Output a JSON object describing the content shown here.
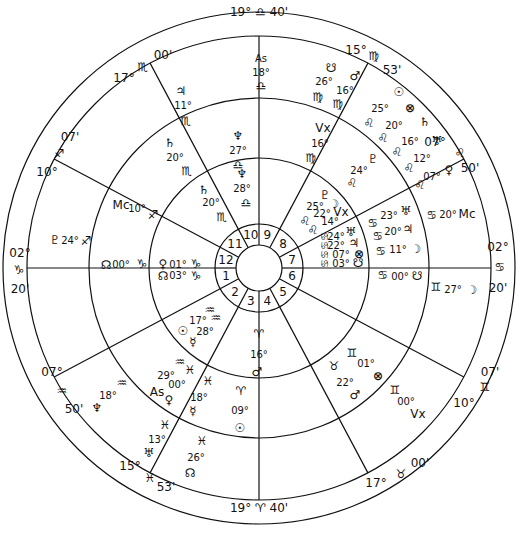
{
  "chart": {
    "center": [
      259,
      268
    ],
    "radii": {
      "outer": 256,
      "cusp_ring": 232,
      "middle": 170,
      "inner": 110,
      "house_ring": 44,
      "hub": 23
    },
    "stroke_color": "#111111",
    "background": "#ffffff"
  },
  "outer_cusps": [
    {
      "id": "cusp-10-top",
      "deg": "19°",
      "sign": "♎",
      "min": "40'",
      "x": 259,
      "y": 11
    },
    {
      "id": "cusp-11",
      "deg": "15°",
      "sign": "♍",
      "min": "53'",
      "x": 368,
      "y": 30
    },
    {
      "id": "cusp-12",
      "deg": "07°",
      "sign": "♌",
      "min": "50'",
      "x": 468,
      "y": 148
    },
    {
      "id": "cusp-1-right",
      "deg": "02°",
      "sign": "♋",
      "min": "20'",
      "x": 495,
      "y": 268
    },
    {
      "id": "cusp-2",
      "deg": "07'",
      "sign": "♊",
      "min": "10°",
      "x": 476,
      "y": 400
    },
    {
      "id": "cusp-3",
      "deg": "17°",
      "sign": "♉",
      "min": "00'",
      "x": 390,
      "y": 487
    },
    {
      "id": "cusp-4-bottom",
      "deg": "19°",
      "sign": "♈",
      "min": "40'",
      "x": 259,
      "y": 508
    },
    {
      "id": "cusp-5",
      "deg": "15°",
      "sign": "♓",
      "min": "53'",
      "x": 150,
      "y": 500
    },
    {
      "id": "cusp-6",
      "deg": "07°",
      "sign": "♒",
      "min": "50'",
      "x": 55,
      "y": 398
    },
    {
      "id": "cusp-7-left",
      "deg": "02°",
      "sign": "♑",
      "min": "20'",
      "x": 22,
      "y": 268
    },
    {
      "id": "cusp-8",
      "deg": "07'",
      "sign": "♐",
      "min": "10°",
      "x": 45,
      "y": 150
    },
    {
      "id": "cusp-9",
      "deg": "17°",
      "sign": "♏",
      "min": "00'",
      "x": 140,
      "y": 58
    }
  ],
  "house_numbers": [
    "1",
    "2",
    "3",
    "4",
    "5",
    "6",
    "7",
    "8",
    "9",
    "10",
    "11",
    "12"
  ],
  "outer_ring_points": [
    {
      "glyph": "As",
      "deg": "18°",
      "sign": "♎",
      "x": 268,
      "y": 80
    },
    {
      "glyph": "☋",
      "deg": "26°",
      "sign": "♍",
      "x": 333,
      "y": 70
    },
    {
      "glyph": "♂",
      "deg": "16°",
      "sign": "♍",
      "x": 353,
      "y": 78
    },
    {
      "glyph": "Vx",
      "deg": "16°",
      "sign": "♍",
      "x": 322,
      "y": 132
    },
    {
      "glyph": "☉",
      "deg": "25°",
      "sign": "♌",
      "x": 390,
      "y": 105
    },
    {
      "glyph": "⊗",
      "deg": "20°",
      "sign": "♌",
      "x": 405,
      "y": 117
    },
    {
      "glyph": "♄",
      "deg": "16°",
      "sign": "♌",
      "x": 423,
      "y": 130
    },
    {
      "glyph": "♅",
      "deg": "12°",
      "sign": "♌",
      "x": 437,
      "y": 146
    },
    {
      "glyph": "♀",
      "deg": "07°",
      "sign": "♌",
      "x": 446,
      "y": 168
    },
    {
      "glyph": "♇",
      "deg": "24°",
      "sign": "♌",
      "x": 370,
      "y": 160
    },
    {
      "glyph": "Mc",
      "deg": "20°",
      "sign": "♋",
      "x": 458,
      "y": 214
    },
    {
      "glyph": "☽",
      "deg": "27°",
      "sign": "♊",
      "x": 470,
      "y": 290
    },
    {
      "glyph": "♃",
      "deg": "11°",
      "sign": "♏",
      "x": 180,
      "y": 98
    },
    {
      "glyph": "Mc",
      "deg": "10°",
      "sign": "♐",
      "x": 130,
      "y": 210
    },
    {
      "glyph": "♇",
      "deg": "24°",
      "sign": "♐",
      "x": 62,
      "y": 241
    },
    {
      "glyph": "☊",
      "deg": "00°",
      "sign": "♑",
      "x": 88,
      "y": 263
    },
    {
      "glyph": "♆",
      "deg": "18°",
      "sign": "♒",
      "x": 103,
      "y": 400
    },
    {
      "glyph": "♅",
      "deg": "13°",
      "sign": "♓",
      "x": 96,
      "y": 456
    },
    {
      "glyph": "☊",
      "deg": "26°",
      "sign": "♓",
      "x": 198,
      "y": 474
    },
    {
      "glyph": "Vx",
      "deg": "00°",
      "sign": "♊",
      "x": 420,
      "y": 420
    }
  ],
  "middle_ring_points": [
    {
      "glyph": "♆",
      "deg": "27°",
      "sign": "♎",
      "x": 237,
      "y": 150
    },
    {
      "glyph": "♄",
      "deg": "20°",
      "sign": "♏",
      "x": 178,
      "y": 175
    },
    {
      "glyph": "♇",
      "deg": "25°",
      "sign": "♌",
      "x": 326,
      "y": 202
    },
    {
      "glyph": "☽",
      "deg": "22°",
      "sign": "♌",
      "x": 334,
      "y": 211
    },
    {
      "glyph": "Vx",
      "deg": "14°",
      "sign": "♌",
      "x": 343,
      "y": 219
    },
    {
      "glyph": "♅",
      "deg": "23°",
      "sign": "♋",
      "x": 393,
      "y": 218
    },
    {
      "glyph": "♃",
      "deg": "20°",
      "sign": "♋",
      "x": 399,
      "y": 232
    },
    {
      "glyph": "☽",
      "deg": "11°",
      "sign": "♋",
      "x": 393,
      "y": 249
    },
    {
      "glyph": "☋",
      "deg": "00°",
      "sign": "♋",
      "x": 395,
      "y": 277
    },
    {
      "glyph": "♀",
      "deg": "00°",
      "sign": "♓",
      "x": 176,
      "y": 385
    },
    {
      "glyph": "As",
      "deg": "29°",
      "sign": "♒",
      "x": 160,
      "y": 385
    },
    {
      "glyph": "☿",
      "deg": "18°",
      "sign": "♓",
      "x": 205,
      "y": 398
    },
    {
      "glyph": "☉",
      "deg": "09°",
      "sign": "♈",
      "x": 240,
      "y": 408
    },
    {
      "glyph": "☿",
      "deg": "22°",
      "sign": "♉",
      "x": 355,
      "y": 393
    },
    {
      "glyph": "⊗",
      "deg": "01°",
      "sign": "♊",
      "x": 378,
      "y": 372
    }
  ],
  "inner_ring_points": [
    {
      "glyph": "♆",
      "deg": "28°",
      "sign": "♎",
      "x": 247,
      "y": 178
    },
    {
      "glyph": "♄",
      "deg": "20°",
      "sign": "♏",
      "x": 210,
      "y": 200
    },
    {
      "glyph": "♅",
      "deg": "24°",
      "sign": "♋",
      "x": 338,
      "y": 238
    },
    {
      "glyph": "♃",
      "deg": "22°",
      "sign": "♋",
      "x": 342,
      "y": 246
    },
    {
      "glyph": "⊗",
      "deg": "07°",
      "sign": "♋",
      "x": 345,
      "y": 256
    },
    {
      "glyph": "☋",
      "deg": "03°",
      "sign": "♋",
      "x": 345,
      "y": 264
    },
    {
      "glyph": "♀",
      "deg": "01°",
      "sign": "♑",
      "x": 180,
      "y": 266
    },
    {
      "glyph": "☊",
      "deg": "03°",
      "sign": "♑",
      "x": 180,
      "y": 274
    },
    {
      "glyph": "☉",
      "deg": "17°",
      "sign": "♒",
      "x": 215,
      "y": 322
    },
    {
      "glyph": "☿",
      "deg": "28°",
      "sign": "♒",
      "x": 215,
      "y": 333
    },
    {
      "glyph": "♂",
      "deg": "16°",
      "sign": "♈",
      "x": 259,
      "y": 345
    }
  ],
  "labels": [
    {
      "t": "19° ♎ 40'",
      "x": 259,
      "y": 12,
      "c": "big"
    },
    {
      "t": "15°",
      "x": 356,
      "y": 50,
      "c": "big"
    },
    {
      "t": "♍",
      "x": 374,
      "y": 56,
      "c": "glyph"
    },
    {
      "t": "53'",
      "x": 392,
      "y": 70,
      "c": "big"
    },
    {
      "t": "07°",
      "x": 435,
      "y": 142,
      "c": "big"
    },
    {
      "t": "♌",
      "x": 460,
      "y": 153,
      "c": "glyph"
    },
    {
      "t": "50'",
      "x": 470,
      "y": 168,
      "c": "big"
    },
    {
      "t": "02°",
      "x": 498,
      "y": 247,
      "c": "big"
    },
    {
      "t": "♋",
      "x": 500,
      "y": 267,
      "c": "glyph"
    },
    {
      "t": "20'",
      "x": 498,
      "y": 288,
      "c": "big"
    },
    {
      "t": "07'",
      "x": 490,
      "y": 372,
      "c": "big"
    },
    {
      "t": "♊",
      "x": 485,
      "y": 387,
      "c": "glyph"
    },
    {
      "t": "10°",
      "x": 464,
      "y": 403,
      "c": "big"
    },
    {
      "t": "00'",
      "x": 420,
      "y": 463,
      "c": "big"
    },
    {
      "t": "♉",
      "x": 401,
      "y": 474,
      "c": "glyph"
    },
    {
      "t": "17°",
      "x": 376,
      "y": 483,
      "c": "big"
    },
    {
      "t": "19° ♈ 40'",
      "x": 259,
      "y": 508,
      "c": "big"
    },
    {
      "t": "15°",
      "x": 130,
      "y": 466,
      "c": "big"
    },
    {
      "t": "♓",
      "x": 150,
      "y": 478,
      "c": "glyph"
    },
    {
      "t": "53'",
      "x": 166,
      "y": 487,
      "c": "big"
    },
    {
      "t": "07°",
      "x": 52,
      "y": 372,
      "c": "big"
    },
    {
      "t": "♒",
      "x": 62,
      "y": 391,
      "c": "glyph"
    },
    {
      "t": "50'",
      "x": 74,
      "y": 409,
      "c": "big"
    },
    {
      "t": "02°",
      "x": 20,
      "y": 253,
      "c": "big"
    },
    {
      "t": "♑",
      "x": 19,
      "y": 270,
      "c": "glyph"
    },
    {
      "t": "20'",
      "x": 20,
      "y": 289,
      "c": "big"
    },
    {
      "t": "07'",
      "x": 70,
      "y": 137,
      "c": "big"
    },
    {
      "t": "♐",
      "x": 59,
      "y": 154,
      "c": "glyph"
    },
    {
      "t": "10°",
      "x": 47,
      "y": 172,
      "c": "big"
    },
    {
      "t": "17°",
      "x": 124,
      "y": 78,
      "c": "big"
    },
    {
      "t": "♏",
      "x": 143,
      "y": 67,
      "c": "glyph"
    },
    {
      "t": "00'",
      "x": 163,
      "y": 55,
      "c": "big"
    }
  ],
  "wheel_texts": [
    {
      "t": "As",
      "x": 261,
      "y": 58
    },
    {
      "t": "18°",
      "x": 261,
      "y": 72
    },
    {
      "t": "♎",
      "x": 261,
      "y": 86,
      "c": "glyph"
    },
    {
      "t": "☋",
      "x": 331,
      "y": 68,
      "c": "glyph"
    },
    {
      "t": "26°",
      "x": 324,
      "y": 81
    },
    {
      "t": "♍",
      "x": 318,
      "y": 97,
      "c": "glyph"
    },
    {
      "t": "♂",
      "x": 355,
      "y": 76,
      "c": "glyph"
    },
    {
      "t": "16°",
      "x": 345,
      "y": 90
    },
    {
      "t": "♍",
      "x": 338,
      "y": 104,
      "c": "glyph"
    },
    {
      "t": "Vx",
      "x": 323,
      "y": 128,
      "c": "big"
    },
    {
      "t": "16°",
      "x": 320,
      "y": 143
    },
    {
      "t": "♍",
      "x": 311,
      "y": 158,
      "c": "glyph"
    },
    {
      "t": "☉",
      "x": 399,
      "y": 92,
      "c": "glyph"
    },
    {
      "t": "25°",
      "x": 380,
      "y": 108
    },
    {
      "t": "♌",
      "x": 369,
      "y": 123,
      "c": "glyph"
    },
    {
      "t": "⊗",
      "x": 410,
      "y": 108,
      "c": "glyph"
    },
    {
      "t": "20°",
      "x": 394,
      "y": 125
    },
    {
      "t": "♌",
      "x": 383,
      "y": 138,
      "c": "glyph"
    },
    {
      "t": "♄",
      "x": 425,
      "y": 122,
      "c": "glyph"
    },
    {
      "t": "16°",
      "x": 410,
      "y": 141
    },
    {
      "t": "♌",
      "x": 397,
      "y": 152,
      "c": "glyph"
    },
    {
      "t": "♅",
      "x": 437,
      "y": 141,
      "c": "glyph"
    },
    {
      "t": "12°",
      "x": 422,
      "y": 158
    },
    {
      "t": "♌",
      "x": 409,
      "y": 168,
      "c": "glyph"
    },
    {
      "t": "07°",
      "x": 432,
      "y": 176
    },
    {
      "t": "♀",
      "x": 449,
      "y": 170,
      "c": "glyph"
    },
    {
      "t": "♌",
      "x": 420,
      "y": 185,
      "c": "glyph"
    },
    {
      "t": "♇",
      "x": 373,
      "y": 159,
      "c": "glyph"
    },
    {
      "t": "24°",
      "x": 359,
      "y": 170
    },
    {
      "t": "♌",
      "x": 352,
      "y": 183,
      "c": "glyph"
    },
    {
      "t": "♋",
      "x": 432,
      "y": 215,
      "c": "glyph"
    },
    {
      "t": "20°",
      "x": 448,
      "y": 214
    },
    {
      "t": "Mc",
      "x": 467,
      "y": 214,
      "c": "big"
    },
    {
      "t": "♊",
      "x": 436,
      "y": 287,
      "c": "glyph"
    },
    {
      "t": "27°",
      "x": 453,
      "y": 289
    },
    {
      "t": "☽",
      "x": 472,
      "y": 290,
      "c": "glyph"
    },
    {
      "t": "♅",
      "x": 406,
      "y": 211,
      "c": "glyph"
    },
    {
      "t": "23°",
      "x": 389,
      "y": 215
    },
    {
      "t": "♋",
      "x": 373,
      "y": 223,
      "c": "glyph"
    },
    {
      "t": "♃",
      "x": 408,
      "y": 229,
      "c": "glyph"
    },
    {
      "t": "20°",
      "x": 393,
      "y": 231
    },
    {
      "t": "♋",
      "x": 378,
      "y": 236,
      "c": "glyph"
    },
    {
      "t": "♋",
      "x": 381,
      "y": 251,
      "c": "glyph"
    },
    {
      "t": "11°",
      "x": 398,
      "y": 249
    },
    {
      "t": "☽",
      "x": 416,
      "y": 249,
      "c": "glyph"
    },
    {
      "t": "♋",
      "x": 383,
      "y": 275,
      "c": "glyph"
    },
    {
      "t": "00°",
      "x": 400,
      "y": 276
    },
    {
      "t": "☋",
      "x": 417,
      "y": 276,
      "c": "glyph"
    },
    {
      "t": "♇",
      "x": 325,
      "y": 195,
      "c": "glyph"
    },
    {
      "t": "☽",
      "x": 334,
      "y": 204,
      "c": "glyph"
    },
    {
      "t": "25°",
      "x": 315,
      "y": 206
    },
    {
      "t": "22°",
      "x": 322,
      "y": 213
    },
    {
      "t": "Vx",
      "x": 341,
      "y": 212,
      "c": "big"
    },
    {
      "t": "14°",
      "x": 330,
      "y": 221
    },
    {
      "t": "♌",
      "x": 305,
      "y": 221,
      "c": "glyph"
    },
    {
      "t": "♌",
      "x": 313,
      "y": 230,
      "c": "glyph"
    },
    {
      "t": "♅",
      "x": 351,
      "y": 232,
      "c": "glyph"
    },
    {
      "t": "24°",
      "x": 336,
      "y": 236
    },
    {
      "t": "♃",
      "x": 354,
      "y": 243,
      "c": "glyph"
    },
    {
      "t": "22°",
      "x": 336,
      "y": 245
    },
    {
      "t": "⊗",
      "x": 359,
      "y": 254,
      "c": "glyph"
    },
    {
      "t": "07°",
      "x": 341,
      "y": 254
    },
    {
      "t": "☋",
      "x": 358,
      "y": 263,
      "c": "glyph"
    },
    {
      "t": "03°",
      "x": 341,
      "y": 263
    },
    {
      "t": "♋♋♋♋",
      "x": 324,
      "y": 250,
      "c": "vert"
    },
    {
      "t": "♃",
      "x": 181,
      "y": 91,
      "c": "glyph"
    },
    {
      "t": "11°",
      "x": 183,
      "y": 105
    },
    {
      "t": "♏",
      "x": 186,
      "y": 121,
      "c": "glyph"
    },
    {
      "t": "♆",
      "x": 238,
      "y": 136,
      "c": "glyph"
    },
    {
      "t": "27°",
      "x": 238,
      "y": 150
    },
    {
      "t": "♎",
      "x": 238,
      "y": 165,
      "c": "glyph"
    },
    {
      "t": "♄",
      "x": 170,
      "y": 143,
      "c": "glyph"
    },
    {
      "t": "20°",
      "x": 175,
      "y": 157
    },
    {
      "t": "♏",
      "x": 187,
      "y": 171,
      "c": "glyph"
    },
    {
      "t": "♆",
      "x": 242,
      "y": 174,
      "c": "glyph"
    },
    {
      "t": "28°",
      "x": 242,
      "y": 188
    },
    {
      "t": "♎",
      "x": 246,
      "y": 203,
      "c": "glyph"
    },
    {
      "t": "♄",
      "x": 204,
      "y": 190,
      "c": "glyph"
    },
    {
      "t": "20°",
      "x": 211,
      "y": 202
    },
    {
      "t": "♏",
      "x": 222,
      "y": 217,
      "c": "glyph"
    },
    {
      "t": "Mc",
      "x": 121,
      "y": 205,
      "c": "big"
    },
    {
      "t": "10°",
      "x": 137,
      "y": 208
    },
    {
      "t": "♐",
      "x": 153,
      "y": 215,
      "c": "glyph"
    },
    {
      "t": "♇",
      "x": 55,
      "y": 240,
      "c": "glyph"
    },
    {
      "t": "24°",
      "x": 70,
      "y": 240
    },
    {
      "t": "♐",
      "x": 86,
      "y": 241,
      "c": "glyph"
    },
    {
      "t": "☊",
      "x": 106,
      "y": 265,
      "c": "glyph"
    },
    {
      "t": "00°",
      "x": 121,
      "y": 264
    },
    {
      "t": "♑",
      "x": 142,
      "y": 264,
      "c": "glyph"
    },
    {
      "t": "♀",
      "x": 163,
      "y": 264,
      "c": "glyph"
    },
    {
      "t": "01°",
      "x": 178,
      "y": 264
    },
    {
      "t": "♑",
      "x": 196,
      "y": 264,
      "c": "glyph"
    },
    {
      "t": "☊",
      "x": 163,
      "y": 276,
      "c": "glyph"
    },
    {
      "t": "03°",
      "x": 178,
      "y": 275
    },
    {
      "t": "♑",
      "x": 196,
      "y": 276,
      "c": "glyph"
    },
    {
      "t": "♒",
      "x": 210,
      "y": 310,
      "c": "glyph"
    },
    {
      "t": "♒",
      "x": 216,
      "y": 318,
      "c": "glyph"
    },
    {
      "t": "17°",
      "x": 198,
      "y": 320
    },
    {
      "t": "☉",
      "x": 183,
      "y": 331,
      "c": "glyph"
    },
    {
      "t": "28°",
      "x": 205,
      "y": 331
    },
    {
      "t": "☿",
      "x": 193,
      "y": 342,
      "c": "glyph"
    },
    {
      "t": "♈",
      "x": 259,
      "y": 334,
      "c": "glyph"
    },
    {
      "t": "16°",
      "x": 259,
      "y": 354
    },
    {
      "t": "♂",
      "x": 257,
      "y": 372,
      "c": "glyph"
    },
    {
      "t": "♒",
      "x": 180,
      "y": 362,
      "c": "glyph"
    },
    {
      "t": "♓",
      "x": 190,
      "y": 370,
      "c": "glyph"
    },
    {
      "t": "29°",
      "x": 166,
      "y": 375
    },
    {
      "t": "00°",
      "x": 177,
      "y": 384
    },
    {
      "t": "As",
      "x": 157,
      "y": 392,
      "c": "big"
    },
    {
      "t": "♀",
      "x": 169,
      "y": 400,
      "c": "glyph"
    },
    {
      "t": "♓",
      "x": 208,
      "y": 381,
      "c": "glyph"
    },
    {
      "t": "18°",
      "x": 199,
      "y": 397
    },
    {
      "t": "☿",
      "x": 193,
      "y": 411,
      "c": "glyph"
    },
    {
      "t": "♈",
      "x": 241,
      "y": 391,
      "c": "glyph"
    },
    {
      "t": "09°",
      "x": 240,
      "y": 410
    },
    {
      "t": "☉",
      "x": 240,
      "y": 428,
      "c": "glyph"
    },
    {
      "t": "♒",
      "x": 122,
      "y": 383,
      "c": "glyph"
    },
    {
      "t": "18°",
      "x": 108,
      "y": 395
    },
    {
      "t": "♆",
      "x": 97,
      "y": 408,
      "c": "glyph"
    },
    {
      "t": "♓",
      "x": 165,
      "y": 425,
      "c": "glyph"
    },
    {
      "t": "13°",
      "x": 157,
      "y": 439
    },
    {
      "t": "♅",
      "x": 149,
      "y": 453,
      "c": "glyph"
    },
    {
      "t": "♓",
      "x": 202,
      "y": 441,
      "c": "glyph"
    },
    {
      "t": "26°",
      "x": 196,
      "y": 457
    },
    {
      "t": "☊",
      "x": 190,
      "y": 473,
      "c": "glyph"
    },
    {
      "t": "♊",
      "x": 352,
      "y": 353,
      "c": "glyph"
    },
    {
      "t": "01°",
      "x": 366,
      "y": 363
    },
    {
      "t": "♉",
      "x": 334,
      "y": 366,
      "c": "glyph"
    },
    {
      "t": "⊗",
      "x": 378,
      "y": 376,
      "c": "glyph"
    },
    {
      "t": "22°",
      "x": 345,
      "y": 382
    },
    {
      "t": "♂",
      "x": 355,
      "y": 395,
      "c": "glyph"
    },
    {
      "t": "♊",
      "x": 395,
      "y": 390,
      "c": "glyph"
    },
    {
      "t": "00°",
      "x": 406,
      "y": 401
    },
    {
      "t": "Vx",
      "x": 418,
      "y": 414,
      "c": "big"
    }
  ]
}
